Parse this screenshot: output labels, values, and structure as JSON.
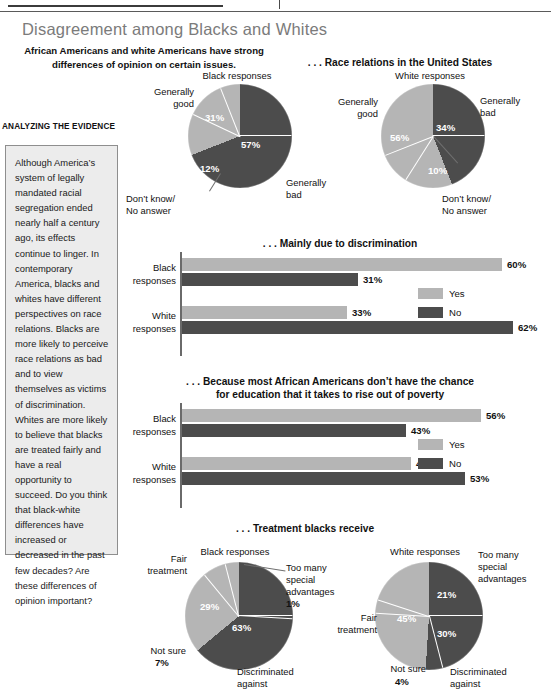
{
  "colors": {
    "light": "#b5b5b5",
    "dark": "#4c4c4c",
    "title": "#7b7b7b",
    "box_bg": "#ececec",
    "box_border": "#8e8e8e"
  },
  "header": {
    "main_title": "Disagreement among Blacks and Whites",
    "subtitle": "African Americans and white Americans have strong differences of opinion on certain issues."
  },
  "sidebar": {
    "heading": "ANALYZING THE EVIDENCE",
    "body": "Although America’s system of legally mandated racial segregation ended nearly half a century ago, its effects continue to linger. In contemporary America, blacks and whites have different perspectives on race relations. Blacks are more likely to perceive race relations as bad and to view themselves as victims of discrimination. Whites are more likely to believe that blacks are treated fairly and have a real opportunity to succeed. Do you think that black-white differences have increased or decreased in the past few decades? Are these differences of opinion important?"
  },
  "legend": {
    "yes": "Yes",
    "no": "No"
  },
  "chart_data": [
    {
      "type": "pie",
      "title": ". . . Race relations in the United States",
      "subject": "Black responses",
      "labels": [
        "Generally bad",
        "Don’t know/ No answer",
        "Generally good"
      ],
      "values": [
        57,
        12,
        31
      ],
      "value_labels": [
        "57%",
        "12%",
        "31%"
      ],
      "colors": [
        "#4c4c4c",
        "#4c4c4c",
        "#b5b5b5"
      ]
    },
    {
      "type": "pie",
      "title": ". . . Race relations in the United States",
      "subject": "White responses",
      "labels": [
        "Generally bad",
        "Don’t know/ No answer",
        "Generally good"
      ],
      "values": [
        34,
        10,
        56
      ],
      "value_labels": [
        "34%",
        "10%",
        "56%"
      ],
      "colors": [
        "#4c4c4c",
        "#4c4c4c",
        "#b5b5b5"
      ]
    },
    {
      "type": "bar",
      "title": ". . . Mainly due to discrimination",
      "orientation": "horizontal",
      "categories": [
        "Black responses",
        "White responses"
      ],
      "series": [
        {
          "name": "Yes",
          "values": [
            60,
            31
          ],
          "color": "#b5b5b5"
        },
        {
          "name": "No",
          "values": [
            33,
            62
          ],
          "color": "#4c4c4c"
        }
      ],
      "value_labels": [
        [
          "60%",
          "33%"
        ],
        [
          "31%",
          "62%"
        ]
      ],
      "xlim": [
        0,
        70
      ]
    },
    {
      "type": "bar",
      "title": ". . . Because most African Americans don’t have the chance for education that it takes to rise out of poverty",
      "orientation": "horizontal",
      "categories": [
        "Black responses",
        "White responses"
      ],
      "series": [
        {
          "name": "Yes",
          "values": [
            56,
            43
          ],
          "color": "#b5b5b5"
        },
        {
          "name": "No",
          "values": [
            42,
            53
          ],
          "color": "#4c4c4c"
        }
      ],
      "value_labels": [
        [
          "56%",
          "42%"
        ],
        [
          "43%",
          "53%"
        ]
      ],
      "xlim": [
        0,
        70
      ]
    },
    {
      "type": "pie",
      "title": ". . . Treatment blacks receive",
      "subject": "Black responses",
      "labels": [
        "Too many special advantages",
        "Discriminated against",
        "Not sure",
        "Fair treatment"
      ],
      "values": [
        1,
        63,
        7,
        29
      ],
      "value_labels": [
        "1%",
        "63%",
        "7%",
        "29%"
      ],
      "colors": [
        "#4c4c4c",
        "#4c4c4c",
        "#b5b5b5",
        "#b5b5b5"
      ]
    },
    {
      "type": "pie",
      "title": ". . . Treatment blacks receive",
      "subject": "White responses",
      "labels": [
        "Too many special advantages",
        "Discriminated against",
        "Not sure",
        "Fair treatment"
      ],
      "values": [
        21,
        30,
        4,
        45
      ],
      "value_labels": [
        "21%",
        "30%",
        "4%",
        "45%"
      ],
      "colors": [
        "#4c4c4c",
        "#4c4c4c",
        "#b5b5b5",
        "#b5b5b5"
      ]
    }
  ],
  "sections": {
    "race_relations_title": ". . . Race relations in the United States",
    "discrimination_title": ". . . Mainly due to discrimination",
    "education_title_line1": ". . . Because most African Americans don’t have the chance",
    "education_title_line2": "for education that it takes to rise out of poverty",
    "treatment_title": ". . . Treatment blacks receive"
  },
  "pie_labels": {
    "black_responses": "Black responses",
    "white_responses": "White responses",
    "generally_good": "Generally good",
    "generally_bad": "Generally bad",
    "dont_know": "Don’t know/ No answer",
    "fair_treatment": "Fair treatment",
    "not_sure": "Not sure",
    "too_many_1": "Too many",
    "too_many_2": "special",
    "too_many_3": "advantages",
    "discriminated_1": "Discriminated",
    "discriminated_2": "against"
  },
  "bar_labels": {
    "black_1": "Black",
    "black_2": "responses",
    "white_1": "White",
    "white_2": "responses"
  }
}
